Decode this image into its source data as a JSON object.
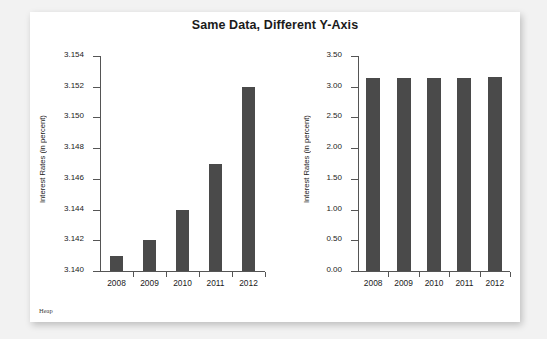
{
  "figure": {
    "title": "Same Data, Different Y-Axis",
    "credit": "Heap",
    "bar_color": "#4a4a4a",
    "background": "#ffffff",
    "page_background": "#f2f2f2"
  },
  "chart_data": [
    {
      "type": "bar",
      "panel": "left",
      "title": "",
      "xlabel": "",
      "ylabel": "Interest Rates (in percent)",
      "categories": [
        "2008",
        "2009",
        "2010",
        "2011",
        "2012"
      ],
      "values": [
        3.141,
        3.142,
        3.144,
        3.147,
        3.152
      ],
      "ylim": [
        3.14,
        3.154
      ],
      "yticks": [
        3.14,
        3.142,
        3.144,
        3.146,
        3.148,
        3.15,
        3.152,
        3.154
      ],
      "ytick_labels": [
        "3.140",
        "3.142",
        "3.144",
        "3.146",
        "3.148",
        "3.150",
        "3.152",
        "3.154"
      ],
      "grid": false,
      "legend": "none"
    },
    {
      "type": "bar",
      "panel": "right",
      "title": "",
      "xlabel": "",
      "ylabel": "Interest Rates (in percent)",
      "categories": [
        "2008",
        "2009",
        "2010",
        "2011",
        "2012"
      ],
      "values": [
        3.141,
        3.142,
        3.144,
        3.147,
        3.152
      ],
      "ylim": [
        0.0,
        3.5
      ],
      "yticks": [
        0.0,
        0.5,
        1.0,
        1.5,
        2.0,
        2.5,
        3.0,
        3.5
      ],
      "ytick_labels": [
        "0.00",
        "0.50",
        "1.00",
        "1.50",
        "2.00",
        "2.50",
        "3.00",
        "3.50"
      ],
      "grid": false,
      "legend": "none"
    }
  ]
}
